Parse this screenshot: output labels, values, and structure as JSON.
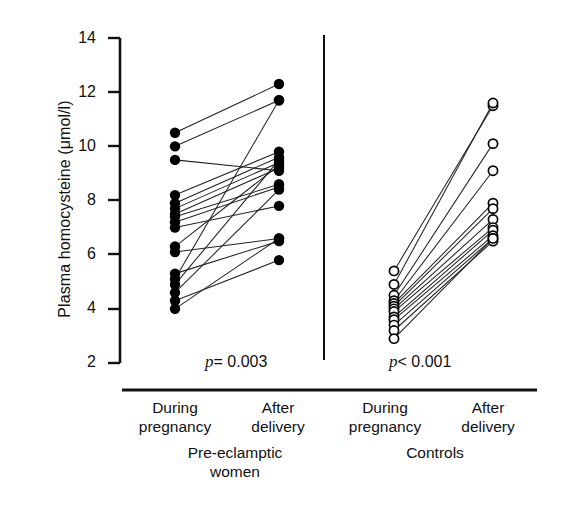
{
  "chart_data": {
    "type": "scatter",
    "title": "",
    "subtitle": "",
    "xlabel": "",
    "ylabel": "Plasma homocysteine (μmol/l)",
    "ylim": [
      2,
      14
    ],
    "yticks": [
      14,
      12,
      10,
      8,
      6,
      4,
      2
    ],
    "ytick_labels": [
      "14",
      "12",
      "10",
      "8",
      "6",
      "4",
      "2"
    ],
    "grid": false,
    "legend": "none",
    "style": "paired-before-after-dot-plot",
    "x_categories": [
      "During pregnancy",
      "After delivery",
      "During pregnancy",
      "After delivery"
    ],
    "groups": [
      {
        "name": "Pre-eclamptic women",
        "marker": "filled-circle",
        "marker_color": "#000000",
        "annotation": "p = 0.003",
        "annotation_operator": "=",
        "annotation_value": "0.003",
        "x_labels": [
          "During pregnancy",
          "After delivery"
        ],
        "pairs": [
          {
            "during": 10.5,
            "after": 12.3
          },
          {
            "during": 10.0,
            "after": 11.7
          },
          {
            "during": 9.5,
            "after": 9.1
          },
          {
            "during": 8.2,
            "after": 9.8
          },
          {
            "during": 7.9,
            "after": 9.6
          },
          {
            "during": 7.7,
            "after": 9.4
          },
          {
            "during": 7.5,
            "after": 9.2
          },
          {
            "during": 7.4,
            "after": 8.6
          },
          {
            "during": 7.2,
            "after": 8.5
          },
          {
            "during": 7.0,
            "after": 7.8
          },
          {
            "during": 6.3,
            "after": 9.3
          },
          {
            "during": 6.1,
            "after": 6.6
          },
          {
            "during": 5.3,
            "after": 6.5
          },
          {
            "during": 5.1,
            "after": 11.7
          },
          {
            "during": 4.9,
            "after": 9.5
          },
          {
            "during": 4.6,
            "after": 8.4
          },
          {
            "during": 4.3,
            "after": 5.8
          },
          {
            "during": 4.0,
            "after": 6.6
          }
        ]
      },
      {
        "name": "Controls",
        "marker": "open-circle",
        "marker_color": "#000000",
        "annotation": "p < 0.001",
        "annotation_operator": "<",
        "annotation_value": "0.001",
        "x_labels": [
          "During pregnancy",
          "After delivery"
        ],
        "pairs": [
          {
            "during": 5.4,
            "after": 11.5
          },
          {
            "during": 4.9,
            "after": 11.6
          },
          {
            "during": 4.5,
            "after": 10.1
          },
          {
            "during": 4.3,
            "after": 9.1
          },
          {
            "during": 4.2,
            "after": 7.9
          },
          {
            "during": 4.1,
            "after": 7.7
          },
          {
            "during": 4.0,
            "after": 7.3
          },
          {
            "during": 3.9,
            "after": 7.0
          },
          {
            "during": 3.7,
            "after": 6.9
          },
          {
            "during": 3.6,
            "after": 6.7
          },
          {
            "during": 3.4,
            "after": 6.6
          },
          {
            "during": 3.2,
            "after": 6.5
          },
          {
            "during": 2.9,
            "after": 6.6
          }
        ]
      }
    ]
  },
  "axis": {
    "ylabel": "Plasma homocysteine (μmol/l)",
    "tick_14": "14",
    "tick_12": "12",
    "tick_10": "10",
    "tick_8": "8",
    "tick_6": "6",
    "tick_4": "4",
    "tick_2": "2"
  },
  "annotations": {
    "p_left_italic": "p",
    "p_left_rest": "= 0.003",
    "p_right_italic": "p",
    "p_right_rest": "< 0.001"
  },
  "categories": {
    "c1_line1": "During",
    "c1_line2": "pregnancy",
    "c2_line1": "After",
    "c2_line2": "delivery",
    "c3_line1": "During",
    "c3_line2": "pregnancy",
    "c4_line1": "After",
    "c4_line2": "delivery",
    "g1_line1": "Pre-eclamptic",
    "g1_line2": "women",
    "g2_line1": "Controls"
  }
}
